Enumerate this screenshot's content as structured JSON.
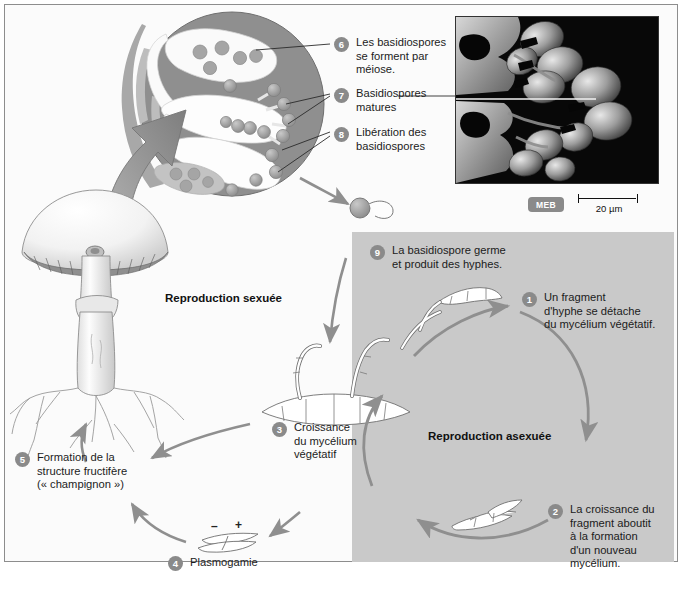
{
  "diagram": {
    "sections": {
      "sexual": "Reproduction sexuée",
      "asexual": "Reproduction asexuée"
    },
    "steps": [
      {
        "n": "1",
        "text": "Un fragment\nd'hyphe se détache\ndu mycélium végétatif."
      },
      {
        "n": "2",
        "text": "La croissance du\nfragment aboutit\nà la formation\nd'un nouveau\nmycélium."
      },
      {
        "n": "3",
        "text": "Croissance\ndu mycélium\nvégétatif"
      },
      {
        "n": "4",
        "text": "Plasmogamie"
      },
      {
        "n": "5",
        "text": "Formation de la\nstructure fructifère\n(« champignon »)"
      },
      {
        "n": "6",
        "text": "Les basidiospores\nse forment par\nméiose."
      },
      {
        "n": "7",
        "text": "Basidiospores\nmatures"
      },
      {
        "n": "8",
        "text": "Libération des\nbasidiospores"
      },
      {
        "n": "9",
        "text": "La basidiospore germe\net produit des hyphes."
      }
    ],
    "labels": {
      "step1": "Un fragment d'hyphe se détache du mycélium végétatif.",
      "step1_l1": "Un fragment",
      "step1_l2": "d'hyphe se détache",
      "step1_l3": "du mycélium végétatif.",
      "step2_l1": "La croissance du",
      "step2_l2": "fragment aboutit",
      "step2_l3": "à la formation",
      "step2_l4": "d'un nouveau",
      "step2_l5": "mycélium.",
      "step3_l1": "Croissance",
      "step3_l2": "du mycélium",
      "step3_l3": "végétatif",
      "step4_l1": "Plasmogamie",
      "step5_l1": "Formation de la",
      "step5_l2": "structure fructifère",
      "step5_l3": "(« champignon »)",
      "step6_l1": "Les basidiospores",
      "step6_l2": "se forment par",
      "step6_l3": "méiose.",
      "step7_l1": "Basidiospores",
      "step7_l2": "matures",
      "step8_l1": "Libération des",
      "step8_l2": "basidiospores",
      "step9_l1": "La basidiospore germe",
      "step9_l2": "et produit des hyphes."
    },
    "mating_types": {
      "minus": "–",
      "plus": "+"
    },
    "micrograph": {
      "technique_badge": "MEB",
      "scale_value": "20 µm"
    },
    "colors": {
      "panel_grey": "#c9c9c9",
      "number_badge": "#8a8a8a",
      "arrow_grey": "#9a9a9a",
      "circle_dark": "#8f8f8f",
      "frame": "#8d8d8d"
    }
  }
}
